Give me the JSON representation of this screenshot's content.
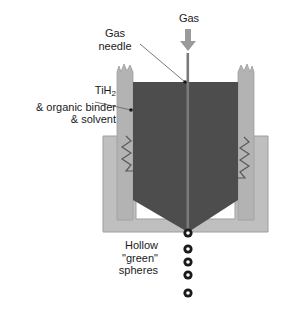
{
  "diagram": {
    "labels": {
      "gas": "Gas",
      "gas_needle_line1": "Gas",
      "gas_needle_line2": "needle",
      "material_line1_prefix": "TiH",
      "material_line1_sub": "2",
      "material_line2": "& organic binder",
      "material_line3": "& solvent",
      "spheres_line1": "Hollow",
      "spheres_line2": "\"green\"",
      "spheres_line3": "spheres"
    },
    "icons": {
      "gas_arrow": "down-arrow-icon",
      "needle": "needle-icon",
      "coil_left": "heater-coil-icon",
      "coil_right": "heater-coil-icon",
      "sphere": "hollow-sphere-icon"
    },
    "colors": {
      "slurry": "#4d4d4d",
      "crucible_wall": "#b3b3b3",
      "outer_jacket": "#bfbfbf",
      "arrow": "#9a9a9a",
      "needle": "#7a7a7a",
      "leader_line": "#6b6b6b",
      "sphere_ring": "#1a1a1a",
      "sphere_core": "#ffffff",
      "text": "#1a1a1a",
      "background": "#ffffff"
    },
    "sphere_count": 5,
    "sphere_positions_y": [
      233,
      249,
      262,
      275,
      293
    ],
    "sphere_center_x": 188
  }
}
